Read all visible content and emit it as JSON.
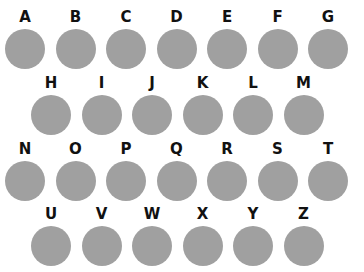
{
  "circle_color": "#a0a0a0",
  "label_color": "#111111",
  "rows": [
    {
      "letters": [
        "A",
        "B",
        "C",
        "D",
        "E",
        "F",
        "G"
      ]
    },
    {
      "letters": [
        "H",
        "I",
        "J",
        "K",
        "L",
        "M"
      ]
    },
    {
      "letters": [
        "N",
        "O",
        "P",
        "Q",
        "R",
        "S",
        "T"
      ]
    },
    {
      "letters": [
        "U",
        "V",
        "W",
        "X",
        "Y",
        "Z"
      ]
    }
  ]
}
